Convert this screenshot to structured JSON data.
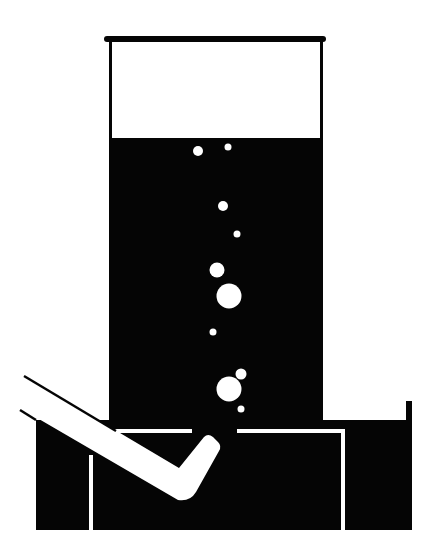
{
  "figure": {
    "title": "Gas collection over water apparatus",
    "width": 437,
    "height": 556,
    "colors": {
      "background": "#ffffff",
      "ink": "#050505",
      "highlight": "#ffffff"
    }
  },
  "cylinder": {
    "label": "Inverted gas jar",
    "x": 109,
    "y": 38,
    "width": 214,
    "rim_y": 38,
    "rim_height": 5,
    "rim_x": 104,
    "rim_width": 222,
    "wall_thickness": 3,
    "gas_space_bottom": 138,
    "liquid_bottom": 430
  },
  "trough": {
    "label": "Water trough",
    "x": 36,
    "y": 420,
    "width": 376,
    "height": 110,
    "right_wall_x": 406,
    "right_wall_top": 401,
    "right_wall_width": 6
  },
  "shelf": {
    "label": "Beehive shelf",
    "top_y": 430,
    "thickness": 4,
    "left_x": 90,
    "right_x": 343,
    "gap_left": 192,
    "gap_right": 237,
    "leg_bottom": 530
  },
  "delivery_tube": {
    "label": "Delivery tube"
  },
  "bubbles": [
    {
      "cx": 198,
      "cy": 151,
      "r": 5
    },
    {
      "cx": 228,
      "cy": 147,
      "r": 3.5
    },
    {
      "cx": 223,
      "cy": 206,
      "r": 5
    },
    {
      "cx": 237,
      "cy": 234,
      "r": 3.5
    },
    {
      "cx": 217,
      "cy": 270,
      "r": 7.5
    },
    {
      "cx": 229,
      "cy": 296,
      "r": 12.5
    },
    {
      "cx": 213,
      "cy": 332,
      "r": 3.5
    },
    {
      "cx": 241,
      "cy": 374,
      "r": 5.5
    },
    {
      "cx": 229,
      "cy": 389,
      "r": 12.5
    },
    {
      "cx": 241,
      "cy": 409,
      "r": 3.5
    }
  ]
}
